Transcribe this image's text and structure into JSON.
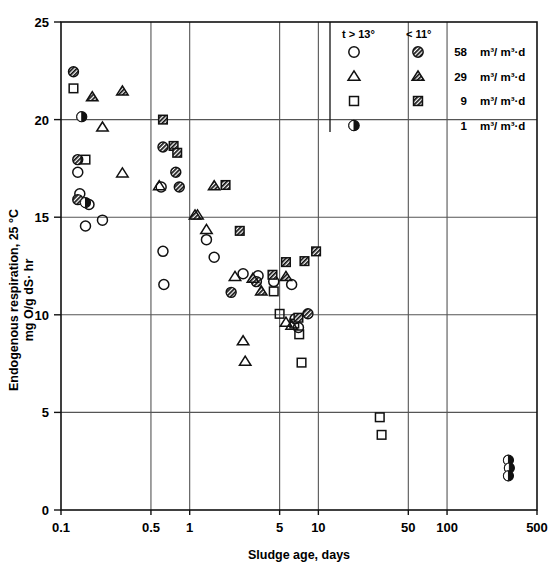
{
  "figure": {
    "background_color": "#ffffff",
    "ink_color": "#111111",
    "grid_color": "#555555"
  },
  "chart_data": {
    "type": "scatter",
    "title": "",
    "xlabel": "Sludge age, days",
    "ylabel_line1": "Endogenous respiration, 25 °C",
    "ylabel_line2": "mg O/g dS· hr",
    "xscale": "log",
    "yscale": "linear",
    "xlim": [
      0.1,
      500
    ],
    "ylim": [
      0,
      25
    ],
    "grid": true,
    "grid_x_values": [
      0.5,
      1,
      5,
      10,
      50,
      100
    ],
    "grid_y_values": [
      5,
      10,
      15,
      20
    ],
    "xticks": [
      0.1,
      0.5,
      1,
      5,
      10,
      50,
      100,
      500
    ],
    "xtick_labels": [
      "0.1",
      "0.5",
      "1",
      "5",
      "10",
      "50",
      "100",
      "500"
    ],
    "yticks": [
      0,
      5,
      10,
      15,
      20,
      25
    ],
    "ytick_labels": [
      "0",
      "5",
      "10",
      "15",
      "20",
      "25"
    ],
    "legend": {
      "position": "top-right-inside",
      "column_headers": [
        "t > 13°",
        "< 11°"
      ],
      "rows": [
        {
          "marker_warm": "circle-open",
          "marker_cold": "circle-hatched",
          "value": "58",
          "unit": "m³/ m³·d"
        },
        {
          "marker_warm": "triangle-open",
          "marker_cold": "triangle-hatched",
          "value": "29",
          "unit": "m³/ m³·d"
        },
        {
          "marker_warm": "square-open",
          "marker_cold": "square-hatched",
          "value": "9",
          "unit": "m³/ m³·d"
        },
        {
          "marker_warm": "circle-halffilled",
          "marker_cold": "",
          "value": "1",
          "unit": "m³/ m³·d"
        }
      ]
    },
    "series": [
      {
        "name": "58 m3/m3-d, t > 13",
        "marker": "circle-open",
        "points": [
          [
            0.135,
            17.3
          ],
          [
            0.14,
            16.2
          ],
          [
            0.165,
            15.65
          ],
          [
            0.155,
            14.55
          ],
          [
            0.21,
            14.85
          ],
          [
            0.6,
            16.55
          ],
          [
            0.62,
            13.25
          ],
          [
            0.63,
            11.55
          ],
          [
            1.35,
            13.85
          ],
          [
            1.55,
            12.95
          ],
          [
            2.6,
            12.1
          ],
          [
            3.4,
            12.0
          ],
          [
            4.5,
            11.7
          ],
          [
            6.2,
            11.55
          ],
          [
            6.6,
            9.8
          ],
          [
            7.0,
            9.35
          ]
        ]
      },
      {
        "name": "58 m3/m3-d, < 11",
        "marker": "circle-hatched",
        "points": [
          [
            0.125,
            22.45
          ],
          [
            0.135,
            17.95
          ],
          [
            0.135,
            15.9
          ],
          [
            0.62,
            18.6
          ],
          [
            0.78,
            17.3
          ],
          [
            0.83,
            16.55
          ],
          [
            2.1,
            11.15
          ],
          [
            3.3,
            11.7
          ],
          [
            8.3,
            10.05
          ]
        ]
      },
      {
        "name": "29 m3/m3-d, t > 13",
        "marker": "triangle-open",
        "points": [
          [
            0.21,
            19.6
          ],
          [
            0.3,
            17.25
          ],
          [
            0.58,
            16.6
          ],
          [
            1.15,
            15.1
          ],
          [
            1.35,
            14.35
          ],
          [
            2.25,
            11.95
          ],
          [
            2.6,
            8.65
          ],
          [
            2.7,
            7.6
          ],
          [
            5.6,
            9.6
          ],
          [
            6.2,
            9.45
          ]
        ]
      },
      {
        "name": "29 m3/m3-d, < 11",
        "marker": "triangle-hatched",
        "points": [
          [
            0.3,
            21.45
          ],
          [
            0.175,
            21.15
          ],
          [
            1.1,
            15.1
          ],
          [
            1.55,
            16.6
          ],
          [
            3.1,
            11.85
          ],
          [
            3.6,
            11.2
          ],
          [
            5.6,
            11.95
          ]
        ]
      },
      {
        "name": "9 m3/m3-d, t > 13",
        "marker": "square-open",
        "points": [
          [
            0.125,
            21.6
          ],
          [
            0.155,
            17.95
          ],
          [
            4.5,
            11.2
          ],
          [
            5.0,
            10.05
          ],
          [
            6.5,
            9.55
          ],
          [
            7.1,
            9.0
          ],
          [
            7.4,
            7.55
          ],
          [
            30,
            4.75
          ],
          [
            31,
            3.85
          ]
        ]
      },
      {
        "name": "9 m3/m3-d, < 11",
        "marker": "square-hatched",
        "points": [
          [
            0.62,
            20.0
          ],
          [
            0.75,
            18.65
          ],
          [
            0.8,
            18.3
          ],
          [
            1.9,
            16.65
          ],
          [
            2.45,
            14.3
          ],
          [
            4.4,
            12.05
          ],
          [
            5.6,
            12.7
          ],
          [
            7.8,
            12.75
          ],
          [
            9.6,
            13.25
          ],
          [
            7.0,
            9.85
          ]
        ]
      },
      {
        "name": "1 m3/m3-d",
        "marker": "circle-halffilled",
        "points": [
          [
            0.145,
            20.15
          ],
          [
            0.155,
            15.75
          ],
          [
            300,
            2.55
          ],
          [
            305,
            2.15
          ],
          [
            300,
            1.75
          ]
        ]
      }
    ]
  },
  "axes_geometry": {
    "plot_left_px": 61,
    "plot_right_px": 537,
    "plot_top_px": 22,
    "plot_bottom_px": 510
  }
}
